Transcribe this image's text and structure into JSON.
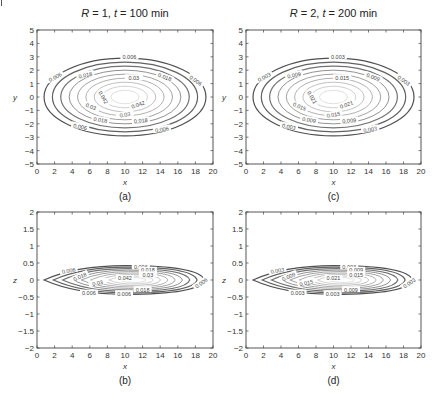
{
  "figure": {
    "panels": [
      {
        "id": "a",
        "caption": "(a)",
        "title_parts": [
          "R",
          " = 1, ",
          "t",
          " = 100 min"
        ],
        "xlabel": "x",
        "ylabel": "y",
        "frame": {
          "x0": 37,
          "y0": 30,
          "x1": 213,
          "y1": 164
        },
        "xlim": [
          0,
          20
        ],
        "ylim": [
          -5,
          5
        ],
        "xticks": [
          0,
          2,
          4,
          6,
          8,
          10,
          12,
          14,
          16,
          18,
          20
        ],
        "yticks": [
          -5,
          -4,
          -3,
          -2,
          -1,
          0,
          1,
          2,
          3,
          4,
          5
        ],
        "plane": "xy",
        "contour_labels": [
          "0.006",
          "0.018",
          "0.03",
          "0.042"
        ]
      },
      {
        "id": "c",
        "caption": "(c)",
        "title_parts": [
          "R",
          " = 2, ",
          "t",
          " = 200 min"
        ],
        "xlabel": "x",
        "ylabel": "y",
        "frame": {
          "x0": 246,
          "y0": 30,
          "x1": 421,
          "y1": 164
        },
        "xlim": [
          0,
          20
        ],
        "ylim": [
          -5,
          5
        ],
        "xticks": [
          0,
          2,
          4,
          6,
          8,
          10,
          12,
          14,
          16,
          18,
          20
        ],
        "yticks": [
          -5,
          -4,
          -3,
          -2,
          -1,
          0,
          1,
          2,
          3,
          4,
          5
        ],
        "plane": "xy",
        "contour_labels": [
          "0.003",
          "0.009",
          "0.015",
          "0.021"
        ]
      },
      {
        "id": "b",
        "caption": "(b)",
        "title_parts": [],
        "xlabel": "x",
        "ylabel": "z",
        "frame": {
          "x0": 37,
          "y0": 212,
          "x1": 213,
          "y1": 348
        },
        "xlim": [
          0,
          20
        ],
        "ylim": [
          -2,
          2
        ],
        "xticks": [
          0,
          2,
          4,
          6,
          8,
          10,
          12,
          14,
          16,
          18,
          20
        ],
        "yticks": [
          -2,
          -1.5,
          -1,
          -0.5,
          0,
          0.5,
          1,
          1.5,
          2
        ],
        "plane": "xz",
        "contour_labels": [
          "0.006",
          "0.018",
          "0.03",
          "0.042"
        ]
      },
      {
        "id": "d",
        "caption": "(d)",
        "title_parts": [],
        "xlabel": "x",
        "ylabel": "z",
        "frame": {
          "x0": 246,
          "y0": 212,
          "x1": 421,
          "y1": 348
        },
        "xlim": [
          0,
          20
        ],
        "ylim": [
          -2,
          2
        ],
        "xticks": [
          0,
          2,
          4,
          6,
          8,
          10,
          12,
          14,
          16,
          18,
          20
        ],
        "yticks": [
          -2,
          -1.5,
          -1,
          -0.5,
          0,
          0.5,
          1,
          1.5,
          2
        ],
        "plane": "xz",
        "contour_labels": [
          "0.003",
          "0.009",
          "0.015",
          "0.021"
        ]
      }
    ]
  },
  "chart_data": [
    {
      "type": "contour",
      "panel": "a",
      "title": "R = 1, t = 100 min",
      "xlabel": "x",
      "ylabel": "y",
      "xlim": [
        0,
        20
      ],
      "ylim": [
        -5,
        5
      ],
      "center": {
        "x": 10,
        "y": 0
      },
      "levels": [
        0.006,
        0.012,
        0.018,
        0.024,
        0.03,
        0.036,
        0.042,
        0.048,
        0.054
      ],
      "labeled_levels": [
        0.006,
        0.018,
        0.03,
        0.042
      ],
      "outer_extent": {
        "x": [
          0.8,
          19.2
        ],
        "y": [
          -2.9,
          2.9
        ]
      },
      "grid": false
    },
    {
      "type": "contour",
      "panel": "c",
      "title": "R = 2, t = 200 min",
      "xlabel": "x",
      "ylabel": "y",
      "xlim": [
        0,
        20
      ],
      "ylim": [
        -5,
        5
      ],
      "center": {
        "x": 10,
        "y": 0
      },
      "levels": [
        0.003,
        0.006,
        0.009,
        0.012,
        0.015,
        0.018,
        0.021,
        0.024,
        0.027
      ],
      "labeled_levels": [
        0.003,
        0.009,
        0.015,
        0.021
      ],
      "outer_extent": {
        "x": [
          0.8,
          19.2
        ],
        "y": [
          -2.9,
          2.9
        ]
      },
      "grid": false
    },
    {
      "type": "contour",
      "panel": "b",
      "title": "",
      "xlabel": "x",
      "ylabel": "z",
      "xlim": [
        0,
        20
      ],
      "ylim": [
        -2,
        2
      ],
      "center": {
        "x": 10,
        "z": 0
      },
      "levels": [
        0.006,
        0.012,
        0.018,
        0.024,
        0.03,
        0.036,
        0.042,
        0.048,
        0.054
      ],
      "labeled_levels": [
        0.006,
        0.018,
        0.03,
        0.042
      ],
      "outer_extent": {
        "x": [
          0.8,
          19.2
        ],
        "z": [
          -0.42,
          0.42
        ]
      },
      "grid": false
    },
    {
      "type": "contour",
      "panel": "d",
      "title": "",
      "xlabel": "x",
      "ylabel": "z",
      "xlim": [
        0,
        20
      ],
      "ylim": [
        -2,
        2
      ],
      "center": {
        "x": 10,
        "z": 0
      },
      "levels": [
        0.003,
        0.006,
        0.009,
        0.012,
        0.015,
        0.018,
        0.021,
        0.024,
        0.027
      ],
      "labeled_levels": [
        0.003,
        0.009,
        0.015,
        0.021
      ],
      "outer_extent": {
        "x": [
          0.8,
          19.2
        ],
        "z": [
          -0.42,
          0.42
        ]
      },
      "grid": false
    }
  ]
}
